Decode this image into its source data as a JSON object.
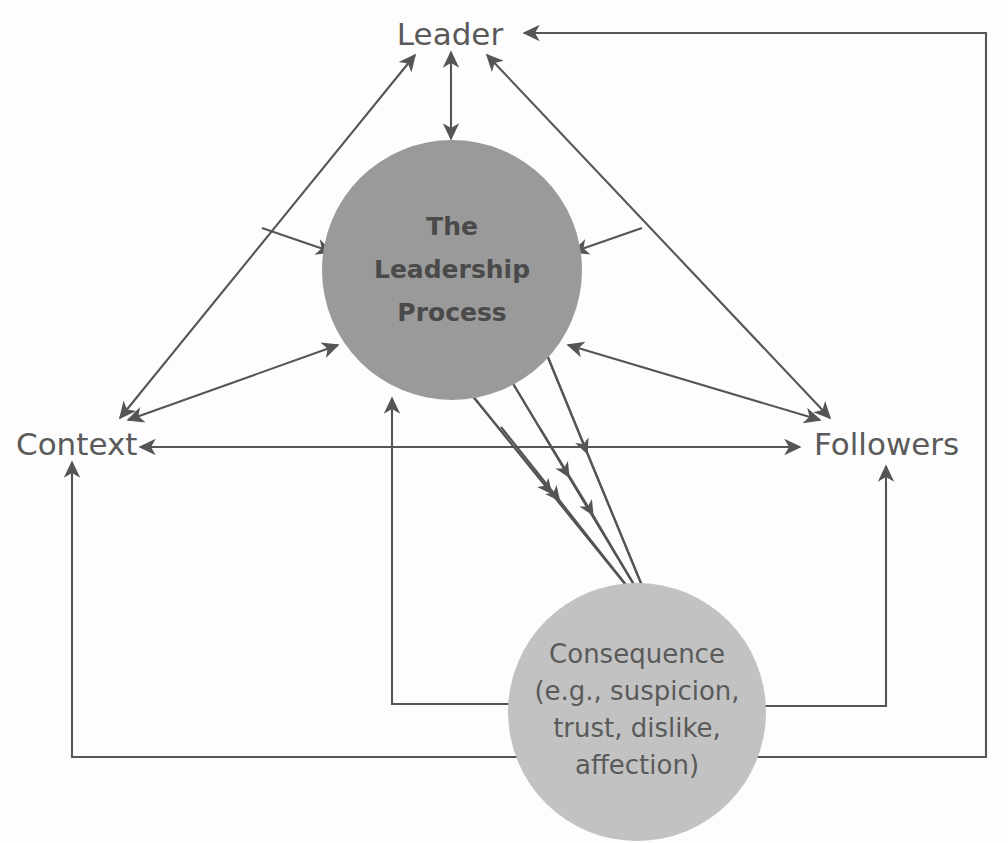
{
  "diagram": {
    "title": "The Leadership Process",
    "background_color": "#fdfdfd",
    "line_color": "#555555",
    "colors": {
      "process_circle_fill": "#9a9a9a",
      "consequence_circle_fill": "#c2c2c2",
      "label_text": "#5a5a5a",
      "bold_text": "#404040",
      "arrow_stroke": "#555555"
    },
    "nodes": {
      "leader": {
        "label": "Leader",
        "x": 450,
        "y": 34,
        "type": "text-node"
      },
      "context": {
        "label": "Context",
        "x": 68,
        "y": 443,
        "type": "text-node"
      },
      "followers": {
        "label": "Followers",
        "x": 880,
        "y": 443,
        "type": "text-node"
      },
      "process": {
        "lines": [
          "The",
          "Leadership",
          "Process"
        ],
        "cx": 452,
        "cy": 270,
        "r": 130,
        "type": "circle-node",
        "fill": "#9a9a9a"
      },
      "consequence": {
        "lines": [
          "Consequence",
          "(e.g., suspicion,",
          "trust, dislike,",
          "affection)"
        ],
        "cx": 637,
        "cy": 712,
        "r": 129,
        "type": "circle-node",
        "fill": "#c2c2c2"
      }
    },
    "edges": [
      {
        "id": "leader-context",
        "from": "Leader",
        "to": "Context",
        "direction": "bidirectional"
      },
      {
        "id": "leader-followers",
        "from": "Leader",
        "to": "Followers",
        "direction": "bidirectional"
      },
      {
        "id": "context-followers",
        "from": "Context",
        "to": "Followers",
        "direction": "bidirectional"
      },
      {
        "id": "leader-process",
        "from": "Leader",
        "to": "The Leadership Process",
        "direction": "bidirectional"
      },
      {
        "id": "context-process",
        "from": "Context",
        "to": "The Leadership Process",
        "direction": "bidirectional"
      },
      {
        "id": "followers-process",
        "from": "Followers",
        "to": "The Leadership Process",
        "direction": "bidirectional"
      },
      {
        "id": "leader-context-branch-process",
        "from": "Leader-Context edge",
        "to": "The Leadership Process",
        "direction": "to-process"
      },
      {
        "id": "leader-followers-branch-process",
        "from": "Leader-Followers edge",
        "to": "The Leadership Process",
        "direction": "to-process"
      },
      {
        "id": "process-consequence-1",
        "from": "The Leadership Process",
        "to": "Consequence",
        "direction": "to-consequence"
      },
      {
        "id": "process-consequence-2",
        "from": "The Leadership Process",
        "to": "Consequence",
        "direction": "to-consequence"
      },
      {
        "id": "process-consequence-3",
        "from": "The Leadership Process",
        "to": "Consequence",
        "direction": "to-consequence"
      },
      {
        "id": "consequence-feedback-process",
        "from": "Consequence",
        "to": "The Leadership Process",
        "direction": "feedback-orthogonal"
      },
      {
        "id": "consequence-feedback-context",
        "from": "Consequence",
        "to": "Context",
        "direction": "feedback-orthogonal"
      },
      {
        "id": "consequence-feedback-followers",
        "from": "Consequence",
        "to": "Followers",
        "direction": "feedback-orthogonal"
      },
      {
        "id": "consequence-feedback-leader",
        "from": "Consequence",
        "to": "Leader",
        "direction": "feedback-orthogonal"
      }
    ]
  }
}
